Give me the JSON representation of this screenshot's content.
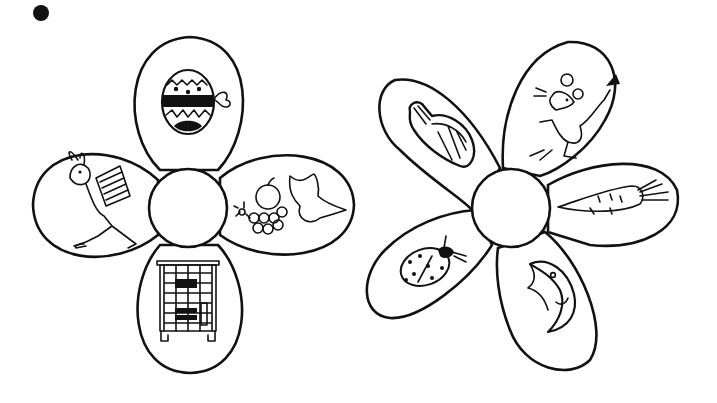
{
  "worksheet": {
    "bullet": "●",
    "flowers": [
      {
        "id": "flower-1",
        "petal_count": 4,
        "center_label": "",
        "petals": [
          {
            "position": "top",
            "picture": "easter-egg"
          },
          {
            "position": "right",
            "picture": "fruit-bowl"
          },
          {
            "position": "bottom",
            "picture": "tiled-stove"
          },
          {
            "position": "left",
            "picture": "rabbit-with-basket"
          }
        ]
      },
      {
        "id": "flower-2",
        "petal_count": 5,
        "center_label": "",
        "petals": [
          {
            "position": "top-left",
            "picture": "hat"
          },
          {
            "position": "top-right",
            "picture": "mouse"
          },
          {
            "position": "right",
            "picture": "carrot"
          },
          {
            "position": "bottom-right",
            "picture": "moon"
          },
          {
            "position": "bottom-left",
            "picture": "ladybug"
          }
        ]
      }
    ],
    "colors": {
      "ink": "#111111",
      "paper": "#ffffff"
    }
  }
}
